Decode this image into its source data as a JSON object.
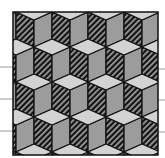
{
  "figure": {
    "width": 165,
    "height": 158,
    "background": "#ffffff",
    "frame": {
      "x": 13,
      "y": 12,
      "width": 145,
      "height": 143,
      "stroke": "#111111",
      "stroke_width": 1.5
    },
    "cube": {
      "half_width": 18,
      "rhombus_half_height": 8,
      "side_length": 27,
      "row_spacing": 35,
      "col_spacing": 36,
      "rows": [
        {
          "cy": 12,
          "x_start": -2
        },
        {
          "cy": 47,
          "x_start": 16
        },
        {
          "cy": 82,
          "x_start": -2
        },
        {
          "cy": 117,
          "x_start": 16
        },
        {
          "cy": 152,
          "x_start": -2
        }
      ],
      "row_above": {
        "cy": -23,
        "x_start": 16
      }
    },
    "colors": {
      "top_face": "#d3d3d3",
      "right_face": "#9c9c9c",
      "hatch_dark": "#141414",
      "hatch_light": "#a8a8a8",
      "edge": "#111111",
      "guide_line": "#9a9a9a"
    },
    "guide_lines": {
      "left": [
        67,
        99,
        131
      ],
      "right": [
        69,
        100,
        132
      ]
    }
  }
}
